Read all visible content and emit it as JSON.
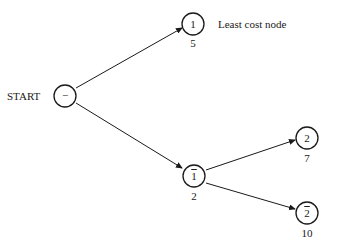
{
  "diagram": {
    "type": "search-tree",
    "start_label": "START",
    "annotation": "Least cost node",
    "nodes": [
      {
        "id": "root",
        "symbol": "−",
        "cost": ""
      },
      {
        "id": "n1",
        "symbol": "1",
        "overline": false,
        "cost": "5"
      },
      {
        "id": "n1bar",
        "symbol": "1",
        "overline": true,
        "cost": "2"
      },
      {
        "id": "n2",
        "symbol": "2",
        "overline": false,
        "cost": "7"
      },
      {
        "id": "n2bar",
        "symbol": "2",
        "overline": true,
        "cost": "10"
      }
    ],
    "edges": [
      {
        "from": "root",
        "to": "n1"
      },
      {
        "from": "root",
        "to": "n1bar"
      },
      {
        "from": "n1bar",
        "to": "n2"
      },
      {
        "from": "n1bar",
        "to": "n2bar"
      }
    ]
  }
}
